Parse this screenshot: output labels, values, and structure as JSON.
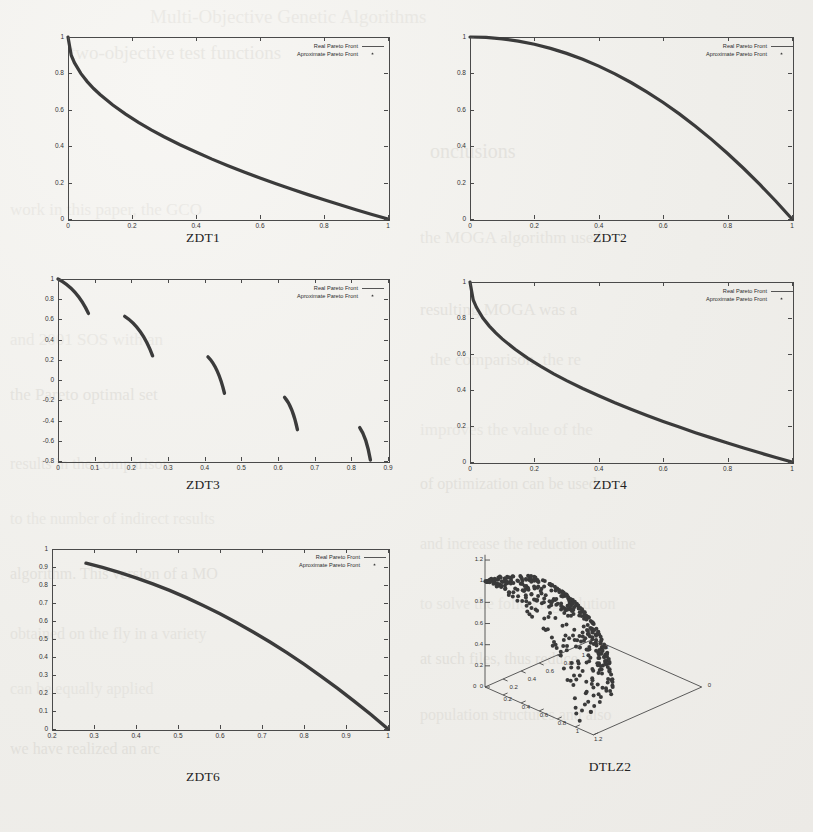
{
  "page": {
    "background_color": "#f2f1ee",
    "ink_color": "#3b3b3b",
    "bleed_lines": [
      {
        "text": "Multi-Objective Genetic Algorithms",
        "x": 150,
        "y": 6,
        "size": 19
      },
      {
        "text": "two-objective test functions",
        "x": 70,
        "y": 42,
        "size": 19
      },
      {
        "text": "onclusions",
        "x": 430,
        "y": 140,
        "size": 20
      },
      {
        "text": "work in this paper, the GCO",
        "x": 10,
        "y": 200,
        "size": 17
      },
      {
        "text": "the MOGA algorithm used",
        "x": 420,
        "y": 228,
        "size": 17
      },
      {
        "text": "resulting MOGA was a",
        "x": 420,
        "y": 300,
        "size": 17
      },
      {
        "text": "and 2001 SOS with an",
        "x": 10,
        "y": 330,
        "size": 17
      },
      {
        "text": "the comparison, the re",
        "x": 430,
        "y": 350,
        "size": 17
      },
      {
        "text": "the Pareto optimal set",
        "x": 10,
        "y": 385,
        "size": 17
      },
      {
        "text": "improves the value of the",
        "x": 420,
        "y": 420,
        "size": 17
      },
      {
        "text": "results in the comparison",
        "x": 10,
        "y": 455,
        "size": 16
      },
      {
        "text": "of optimization can be used",
        "x": 420,
        "y": 475,
        "size": 16
      },
      {
        "text": "to the number of indirect results",
        "x": 10,
        "y": 510,
        "size": 16
      },
      {
        "text": "and increase the reduction outline",
        "x": 420,
        "y": 535,
        "size": 16
      },
      {
        "text": "algorithm. This version of a MO",
        "x": 10,
        "y": 565,
        "size": 16
      },
      {
        "text": "to solve the following solution",
        "x": 420,
        "y": 595,
        "size": 16
      },
      {
        "text": "obtained on the fly in a variety",
        "x": 10,
        "y": 625,
        "size": 16
      },
      {
        "text": "at such files, thus reduce",
        "x": 420,
        "y": 650,
        "size": 16
      },
      {
        "text": "can be equally applied",
        "x": 10,
        "y": 680,
        "size": 16
      },
      {
        "text": "population structures and also",
        "x": 420,
        "y": 706,
        "size": 16
      },
      {
        "text": "we have realized an arc",
        "x": 10,
        "y": 740,
        "size": 16
      }
    ]
  },
  "legend": {
    "real_label": "Real Pareto Front",
    "approx_label": "Aproximate Pareto Front"
  },
  "chart_data": [
    {
      "type": "line",
      "title": "ZDT1",
      "xlabel": "",
      "ylabel": "",
      "xlim": [
        0,
        1
      ],
      "ylim": [
        0,
        1
      ],
      "xticks": [
        "0",
        "0.2",
        "0.4",
        "0.6",
        "0.8",
        "1"
      ],
      "yticks": [
        "0",
        "0.2",
        "0.4",
        "0.6",
        "0.8",
        "1"
      ],
      "grid": false,
      "legend_position": "top-right",
      "series": [
        {
          "name": "Real Pareto Front",
          "x": [
            0,
            0.01,
            0.02,
            0.04,
            0.06,
            0.08,
            0.1,
            0.14,
            0.18,
            0.22,
            0.26,
            0.3,
            0.35,
            0.4,
            0.45,
            0.5,
            0.55,
            0.6,
            0.65,
            0.7,
            0.75,
            0.8,
            0.85,
            0.9,
            0.95,
            1
          ],
          "y": [
            1,
            0.9,
            0.859,
            0.8,
            0.755,
            0.717,
            0.684,
            0.626,
            0.576,
            0.531,
            0.49,
            0.452,
            0.408,
            0.368,
            0.329,
            0.293,
            0.258,
            0.225,
            0.194,
            0.163,
            0.134,
            0.106,
            0.078,
            0.051,
            0.025,
            0
          ]
        },
        {
          "name": "Aproximate Pareto Front",
          "x": [
            0,
            0.01,
            0.02,
            0.04,
            0.06,
            0.08,
            0.1,
            0.14,
            0.18,
            0.22,
            0.26,
            0.3,
            0.35,
            0.4,
            0.45,
            0.5,
            0.55,
            0.6,
            0.65,
            0.7,
            0.75,
            0.8,
            0.85,
            0.9,
            0.95,
            1
          ],
          "y": [
            1,
            0.9,
            0.859,
            0.8,
            0.755,
            0.717,
            0.684,
            0.626,
            0.576,
            0.531,
            0.49,
            0.452,
            0.408,
            0.368,
            0.329,
            0.293,
            0.258,
            0.225,
            0.194,
            0.163,
            0.134,
            0.106,
            0.078,
            0.051,
            0.025,
            0
          ]
        }
      ]
    },
    {
      "type": "line",
      "title": "ZDT2",
      "xlabel": "",
      "ylabel": "",
      "xlim": [
        0,
        1
      ],
      "ylim": [
        0,
        1
      ],
      "xticks": [
        "0",
        "0.2",
        "0.4",
        "0.6",
        "0.8",
        "1"
      ],
      "yticks": [
        "0",
        "0.2",
        "0.4",
        "0.6",
        "0.8",
        "1"
      ],
      "grid": false,
      "legend_position": "top-right",
      "series": [
        {
          "name": "Real Pareto Front",
          "x": [
            0,
            0.05,
            0.1,
            0.15,
            0.2,
            0.25,
            0.3,
            0.35,
            0.4,
            0.45,
            0.5,
            0.55,
            0.6,
            0.65,
            0.7,
            0.75,
            0.8,
            0.85,
            0.9,
            0.95,
            1
          ],
          "y": [
            1,
            0.9975,
            0.99,
            0.9775,
            0.96,
            0.9375,
            0.91,
            0.8775,
            0.84,
            0.7975,
            0.75,
            0.6975,
            0.64,
            0.5775,
            0.51,
            0.4375,
            0.36,
            0.2775,
            0.19,
            0.0975,
            0
          ]
        },
        {
          "name": "Aproximate Pareto Front",
          "x": [
            0,
            0.05,
            0.1,
            0.15,
            0.2,
            0.25,
            0.3,
            0.35,
            0.4,
            0.45,
            0.5,
            0.55,
            0.6,
            0.65,
            0.7,
            0.75,
            0.8,
            0.85,
            0.9,
            0.95,
            1
          ],
          "y": [
            1,
            0.9975,
            0.99,
            0.9775,
            0.96,
            0.9375,
            0.91,
            0.8775,
            0.84,
            0.7975,
            0.75,
            0.6975,
            0.64,
            0.5775,
            0.51,
            0.4375,
            0.36,
            0.2775,
            0.19,
            0.0975,
            0
          ]
        }
      ]
    },
    {
      "type": "line",
      "title": "ZDT3",
      "xlabel": "",
      "ylabel": "",
      "xlim": [
        0,
        0.9
      ],
      "ylim": [
        -0.8,
        1
      ],
      "xticks": [
        "0",
        "0.1",
        "0.2",
        "0.3",
        "0.4",
        "0.5",
        "0.6",
        "0.7",
        "0.8",
        "0.9"
      ],
      "yticks": [
        "-0.8",
        "-0.6",
        "-0.4",
        "-0.2",
        "0",
        "0.2",
        "0.4",
        "0.6",
        "0.8",
        "1"
      ],
      "grid": false,
      "legend_position": "top-right",
      "disconnected_segments": 5,
      "segments": [
        {
          "x0": 0.0,
          "x1": 0.083,
          "y0": 1.0,
          "y1": 0.66
        },
        {
          "x0": 0.182,
          "x1": 0.258,
          "y0": 0.63,
          "y1": 0.24
        },
        {
          "x0": 0.409,
          "x1": 0.454,
          "y0": 0.23,
          "y1": -0.13
        },
        {
          "x0": 0.618,
          "x1": 0.653,
          "y0": -0.17,
          "y1": -0.49
        },
        {
          "x0": 0.823,
          "x1": 0.852,
          "y0": -0.47,
          "y1": -0.79
        }
      ]
    },
    {
      "type": "line",
      "title": "ZDT4",
      "xlabel": "",
      "ylabel": "",
      "xlim": [
        0,
        1
      ],
      "ylim": [
        0,
        1
      ],
      "xticks": [
        "0",
        "0.2",
        "0.4",
        "0.6",
        "0.8",
        "1"
      ],
      "yticks": [
        "0",
        "0.2",
        "0.4",
        "0.6",
        "0.8",
        "1"
      ],
      "grid": false,
      "legend_position": "top-right",
      "series": [
        {
          "name": "Real Pareto Front",
          "x": [
            0,
            0.01,
            0.02,
            0.04,
            0.06,
            0.08,
            0.1,
            0.14,
            0.18,
            0.22,
            0.26,
            0.3,
            0.35,
            0.4,
            0.45,
            0.5,
            0.55,
            0.6,
            0.65,
            0.7,
            0.75,
            0.8,
            0.85,
            0.9,
            0.95,
            1
          ],
          "y": [
            1,
            0.9,
            0.859,
            0.8,
            0.755,
            0.717,
            0.684,
            0.626,
            0.576,
            0.531,
            0.49,
            0.452,
            0.408,
            0.368,
            0.329,
            0.293,
            0.258,
            0.225,
            0.194,
            0.163,
            0.134,
            0.106,
            0.078,
            0.051,
            0.025,
            0
          ]
        },
        {
          "name": "Aproximate Pareto Front",
          "x": [
            0,
            0.01,
            0.02,
            0.04,
            0.06,
            0.08,
            0.1,
            0.14,
            0.18,
            0.22,
            0.26,
            0.3,
            0.35,
            0.4,
            0.45,
            0.5,
            0.55,
            0.6,
            0.65,
            0.7,
            0.75,
            0.8,
            0.85,
            0.9,
            0.95,
            1
          ],
          "y": [
            1,
            0.9,
            0.859,
            0.8,
            0.755,
            0.717,
            0.684,
            0.626,
            0.576,
            0.531,
            0.49,
            0.452,
            0.408,
            0.368,
            0.329,
            0.293,
            0.258,
            0.225,
            0.194,
            0.163,
            0.134,
            0.106,
            0.078,
            0.051,
            0.025,
            0
          ]
        }
      ]
    },
    {
      "type": "line",
      "title": "ZDT6",
      "xlabel": "",
      "ylabel": "",
      "xlim": [
        0.2,
        1
      ],
      "ylim": [
        0,
        1
      ],
      "xticks": [
        "0.2",
        "0.3",
        "0.4",
        "0.5",
        "0.6",
        "0.7",
        "0.8",
        "0.9",
        "1"
      ],
      "yticks": [
        "0",
        "0.1",
        "0.2",
        "0.3",
        "0.4",
        "0.5",
        "0.6",
        "0.7",
        "0.8",
        "0.9",
        "1"
      ],
      "grid": false,
      "legend_position": "top-right",
      "series": [
        {
          "name": "Real Pareto Front",
          "x": [
            0.281,
            0.32,
            0.36,
            0.4,
            0.44,
            0.48,
            0.52,
            0.56,
            0.6,
            0.64,
            0.68,
            0.72,
            0.76,
            0.8,
            0.84,
            0.88,
            0.92,
            0.96,
            1
          ],
          "y": [
            0.921,
            0.898,
            0.87,
            0.84,
            0.806,
            0.77,
            0.73,
            0.686,
            0.64,
            0.59,
            0.537,
            0.482,
            0.423,
            0.36,
            0.294,
            0.226,
            0.154,
            0.079,
            0
          ]
        },
        {
          "name": "Aproximate Pareto Front",
          "x": [
            0.281,
            0.32,
            0.36,
            0.4,
            0.44,
            0.48,
            0.52,
            0.56,
            0.6,
            0.64,
            0.68,
            0.72,
            0.76,
            0.8,
            0.84,
            0.88,
            0.92,
            0.96,
            1
          ],
          "y": [
            0.921,
            0.898,
            0.87,
            0.84,
            0.806,
            0.77,
            0.73,
            0.686,
            0.64,
            0.59,
            0.537,
            0.482,
            0.423,
            0.36,
            0.294,
            0.226,
            0.154,
            0.079,
            0
          ]
        }
      ]
    },
    {
      "type": "scatter",
      "title": "DTLZ2",
      "projection": "3d",
      "xlabel": "",
      "ylabel": "",
      "zlabel": "",
      "xlim": [
        0,
        1.2
      ],
      "ylim": [
        0,
        1.2
      ],
      "zlim": [
        0,
        1.2
      ],
      "xticks": [
        "0",
        "0.2",
        "0.4",
        "0.6",
        "0.8",
        "1",
        "1.2"
      ],
      "yticks": [
        "0",
        "0.2",
        "0.4",
        "0.6",
        "0.8",
        "1",
        "1.2"
      ],
      "zticks": [
        "0",
        "0.2",
        "0.4",
        "0.6",
        "0.8",
        "1",
        "1.2"
      ],
      "grid": false,
      "n_points": 400,
      "surface": "unit sphere octant",
      "description": "Approximate Pareto front points distributed on the first octant of a unit sphere"
    }
  ]
}
